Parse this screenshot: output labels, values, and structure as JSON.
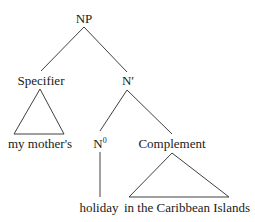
{
  "tree": {
    "root": {
      "label": "NP"
    },
    "specifier": {
      "label": "Specifier",
      "leaf": "my mother's",
      "leaf_type": "triangle"
    },
    "n_bar": {
      "label": "N′"
    },
    "head": {
      "label": "N",
      "superscript": "0",
      "leaf": "holiday",
      "leaf_type": "line"
    },
    "complement": {
      "label": "Complement",
      "leaf": "in the Caribbean Islands",
      "leaf_type": "triangle"
    }
  },
  "colors": {
    "ink": "#1a1a1a",
    "background": "#ffffff"
  }
}
